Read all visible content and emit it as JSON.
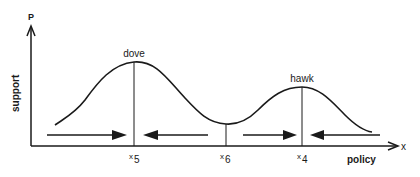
{
  "diagram": {
    "axes": {
      "y_symbol": "P",
      "y_label": "support",
      "x_symbol": "x",
      "x_label": "policy"
    },
    "peaks": [
      {
        "label": "dove",
        "position_label": "x",
        "position_sub": "5"
      },
      {
        "label": "hawk",
        "position_label": "x",
        "position_sub": "4"
      }
    ],
    "trough": {
      "position_label": "x",
      "position_sub": "6"
    },
    "arrows": [
      {
        "from": "left",
        "direction": "right",
        "toward": "x5"
      },
      {
        "from": "x6",
        "direction": "left",
        "toward": "x5"
      },
      {
        "from": "x6",
        "direction": "right",
        "toward": "x4"
      },
      {
        "from": "right",
        "direction": "left",
        "toward": "x4"
      }
    ],
    "colors": {
      "ink": "#1a1a1a",
      "background": "#ffffff"
    }
  }
}
